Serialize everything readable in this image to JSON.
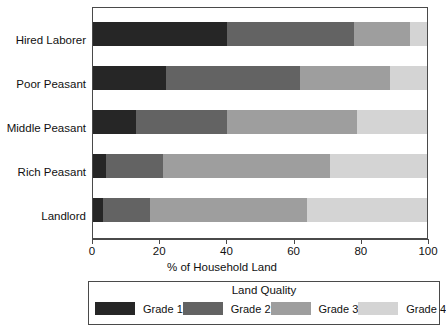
{
  "chart_data": {
    "type": "bar",
    "orientation": "horizontal",
    "stacked": true,
    "title": "",
    "xlabel": "% of Household Land",
    "ylabel": "",
    "xlim": [
      0,
      100
    ],
    "xticks": [
      0,
      20,
      40,
      60,
      80,
      100
    ],
    "xtick_labels": [
      "0",
      "20",
      "40",
      "60",
      "80",
      "100"
    ],
    "grid": false,
    "categories": [
      "Hired Laborer",
      "Poor Peasant",
      "Middle Peasant",
      "Rich Peasant",
      "Landlord"
    ],
    "legend": {
      "title": "Land Quality",
      "position": "bottom",
      "entries": [
        "Grade 1",
        "Grade 2",
        "Grade 3",
        "Grade 4"
      ]
    },
    "series": [
      {
        "name": "Grade 1",
        "color": "#262626",
        "values": [
          40,
          22,
          13,
          4,
          3
        ]
      },
      {
        "name": "Grade 2",
        "color": "#636363",
        "values": [
          38,
          40,
          27,
          17,
          14
        ]
      },
      {
        "name": "Grade 3",
        "color": "#9e9e9e",
        "values": [
          17,
          27,
          39,
          50,
          47
        ]
      },
      {
        "name": "Grade 4",
        "color": "#d4d4d4",
        "values": [
          5,
          11,
          21,
          29,
          36
        ]
      }
    ]
  }
}
